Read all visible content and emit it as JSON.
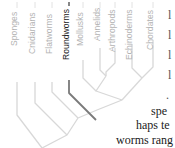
{
  "diagram": {
    "type": "cladogram",
    "highlight_color": "#7a7a7a",
    "line_color": "#d6d6d6",
    "taxa": [
      {
        "label": "Sponges",
        "highlighted": false
      },
      {
        "label": "Cnidarians",
        "highlighted": false
      },
      {
        "label": "Flatworms",
        "highlighted": false
      },
      {
        "label": "Roundworms",
        "highlighted": true
      },
      {
        "label": "Mollusks",
        "highlighted": false
      },
      {
        "label": "Annelids",
        "highlighted": false
      },
      {
        "label": "Arthropods",
        "highlighted": false
      },
      {
        "label": "Echinoderms",
        "highlighted": false
      },
      {
        "label": "Chordates",
        "highlighted": false
      }
    ]
  },
  "text_fragments": {
    "line1": "spe",
    "line2": "haps te",
    "line3": "worms rang"
  }
}
